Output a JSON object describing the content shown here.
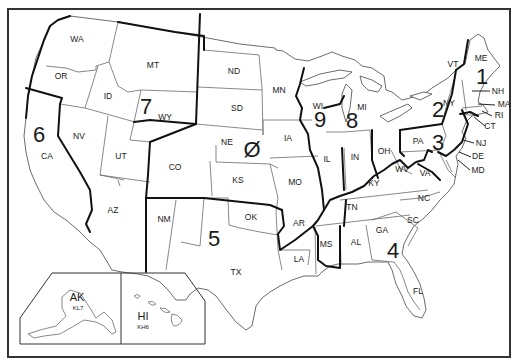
{
  "map": {
    "title": "US Amateur Radio Call Districts",
    "colors": {
      "background": "#ffffff",
      "lines": "#111111",
      "state_borders": "#6a6a6a",
      "text": "#1a1a1a"
    },
    "districts": [
      {
        "number": "1",
        "x": 482,
        "y": 84
      },
      {
        "number": "2",
        "x": 438,
        "y": 117
      },
      {
        "number": "3",
        "x": 438,
        "y": 150
      },
      {
        "number": "4",
        "x": 393,
        "y": 258
      },
      {
        "number": "5",
        "x": 214,
        "y": 246
      },
      {
        "number": "6",
        "x": 39,
        "y": 142
      },
      {
        "number": "7",
        "x": 146,
        "y": 114
      },
      {
        "number": "8",
        "x": 352,
        "y": 128
      },
      {
        "number": "9",
        "x": 320,
        "y": 127
      },
      {
        "number": "Ø",
        "x": 252,
        "y": 157
      }
    ],
    "states": [
      {
        "abbr": "WA",
        "x": 77,
        "y": 42
      },
      {
        "abbr": "OR",
        "x": 61,
        "y": 79
      },
      {
        "abbr": "CA",
        "x": 47,
        "y": 159
      },
      {
        "abbr": "NV",
        "x": 79,
        "y": 139
      },
      {
        "abbr": "ID",
        "x": 108,
        "y": 99
      },
      {
        "abbr": "MT",
        "x": 153,
        "y": 68
      },
      {
        "abbr": "WY",
        "x": 165,
        "y": 120
      },
      {
        "abbr": "UT",
        "x": 121,
        "y": 159
      },
      {
        "abbr": "AZ",
        "x": 113,
        "y": 213
      },
      {
        "abbr": "CO",
        "x": 175,
        "y": 170
      },
      {
        "abbr": "NM",
        "x": 164,
        "y": 222
      },
      {
        "abbr": "ND",
        "x": 234,
        "y": 74
      },
      {
        "abbr": "SD",
        "x": 237,
        "y": 111
      },
      {
        "abbr": "NE",
        "x": 227,
        "y": 145
      },
      {
        "abbr": "KS",
        "x": 238,
        "y": 183
      },
      {
        "abbr": "OK",
        "x": 251,
        "y": 220
      },
      {
        "abbr": "TX",
        "x": 236,
        "y": 275
      },
      {
        "abbr": "MN",
        "x": 279,
        "y": 93
      },
      {
        "abbr": "IA",
        "x": 288,
        "y": 141
      },
      {
        "abbr": "MO",
        "x": 295,
        "y": 185
      },
      {
        "abbr": "AR",
        "x": 299,
        "y": 226
      },
      {
        "abbr": "LA",
        "x": 299,
        "y": 262
      },
      {
        "abbr": "WI",
        "x": 318,
        "y": 109
      },
      {
        "abbr": "IL",
        "x": 327,
        "y": 162
      },
      {
        "abbr": "MI",
        "x": 362,
        "y": 110
      },
      {
        "abbr": "IN",
        "x": 355,
        "y": 160
      },
      {
        "abbr": "OH",
        "x": 384,
        "y": 154
      },
      {
        "abbr": "KY",
        "x": 374,
        "y": 186
      },
      {
        "abbr": "TN",
        "x": 352,
        "y": 210
      },
      {
        "abbr": "MS",
        "x": 326,
        "y": 247
      },
      {
        "abbr": "AL",
        "x": 356,
        "y": 245
      },
      {
        "abbr": "GA",
        "x": 382,
        "y": 233
      },
      {
        "abbr": "SC",
        "x": 413,
        "y": 223
      },
      {
        "abbr": "NC",
        "x": 424,
        "y": 201
      },
      {
        "abbr": "FL",
        "x": 418,
        "y": 294
      },
      {
        "abbr": "WV",
        "x": 402,
        "y": 172
      },
      {
        "abbr": "VA",
        "x": 425,
        "y": 176
      },
      {
        "abbr": "PA",
        "x": 418,
        "y": 144
      },
      {
        "abbr": "NY",
        "x": 449,
        "y": 106
      },
      {
        "abbr": "VT",
        "x": 453,
        "y": 67
      },
      {
        "abbr": "ME",
        "x": 481,
        "y": 61
      }
    ],
    "callouts": [
      {
        "abbr": "NH",
        "x": 498,
        "y": 94,
        "lx1": 472,
        "ly1": 91,
        "lx2": 490,
        "ly2": 91
      },
      {
        "abbr": "MA",
        "x": 504,
        "y": 107,
        "lx1": 478,
        "ly1": 104,
        "lx2": 495,
        "ly2": 105
      },
      {
        "abbr": "RI",
        "x": 499,
        "y": 118,
        "lx1": 482,
        "ly1": 111,
        "lx2": 492,
        "ly2": 116
      },
      {
        "abbr": "CT",
        "x": 490,
        "y": 129,
        "lx1": 474,
        "ly1": 117,
        "lx2": 485,
        "ly2": 126
      },
      {
        "abbr": "NJ",
        "x": 481,
        "y": 146,
        "lx1": 463,
        "ly1": 140,
        "lx2": 474,
        "ly2": 143
      },
      {
        "abbr": "DE",
        "x": 478,
        "y": 159,
        "lx1": 459,
        "ly1": 152,
        "lx2": 471,
        "ly2": 157
      },
      {
        "abbr": "MD",
        "x": 478,
        "y": 173,
        "lx1": 458,
        "ly1": 160,
        "lx2": 470,
        "ly2": 170
      }
    ],
    "insets": {
      "alaska": {
        "abbr": "AK",
        "prefix": "KL7",
        "x": 77,
        "y": 301
      },
      "hawaii": {
        "abbr": "HI",
        "prefix": "KH6",
        "x": 143,
        "y": 320
      }
    }
  }
}
